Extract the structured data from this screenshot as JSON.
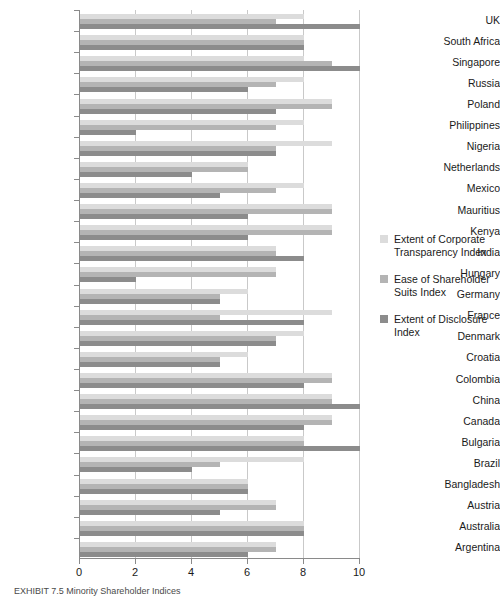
{
  "chart_data": {
    "type": "bar",
    "orientation": "horizontal",
    "title": "",
    "xlabel": "",
    "ylabel": "",
    "xlim": [
      0,
      10
    ],
    "xticks": [
      0,
      2,
      4,
      6,
      8,
      10
    ],
    "grid": true,
    "legend_position": "right",
    "categories": [
      "UK",
      "South Africa",
      "Singapore",
      "Russia",
      "Poland",
      "Philippines",
      "Nigeria",
      "Netherlands",
      "Mexico",
      "Mauritius",
      "Kenya",
      "India",
      "Hungary",
      "Germany",
      "France",
      "Denmark",
      "Croatia",
      "Colombia",
      "China",
      "Canada",
      "Bulgaria",
      "Brazil",
      "Bangladesh",
      "Austria",
      "Australia",
      "Argentina"
    ],
    "series": [
      {
        "name": "Extent of Corporate Transparency Index",
        "color": "#dcdcdc",
        "values": [
          8,
          8,
          8,
          8,
          9,
          8,
          9,
          6,
          8,
          9,
          9,
          7,
          7,
          6,
          9,
          8,
          6,
          9,
          9,
          9,
          8,
          8,
          6,
          7,
          8,
          7
        ]
      },
      {
        "name": "Ease of Shareholder Suits Index",
        "color": "#b4b4b4",
        "values": [
          7,
          8,
          9,
          7,
          9,
          7,
          7,
          6,
          7,
          9,
          9,
          7,
          7,
          5,
          5,
          7,
          5,
          9,
          9,
          9,
          8,
          5,
          6,
          7,
          8,
          7
        ]
      },
      {
        "name": "Extent of Disclosure Index",
        "color": "#8c8c8c",
        "values": [
          10,
          8,
          10,
          6,
          7,
          2,
          7,
          4,
          5,
          6,
          6,
          8,
          2,
          5,
          8,
          7,
          5,
          8,
          10,
          8,
          10,
          4,
          6,
          5,
          8,
          6
        ]
      }
    ]
  },
  "legend": {
    "entries": [
      "Extent of Corporate Transparency Index",
      "Ease of Shareholder Suits Index",
      "Extent of Disclosure Index"
    ],
    "entry_lines": [
      [
        "Extent of Corporate",
        "Transparency Index"
      ],
      [
        "Ease of Shareholder",
        "Suits Index"
      ],
      [
        "Extent of Disclosure",
        "Index"
      ]
    ]
  },
  "caption": {
    "text": "EXHIBIT 7.5  Minority Shareholder Indices"
  },
  "colors": {
    "series1": "#dcdcdc",
    "series2": "#b4b4b4",
    "series3": "#8c8c8c",
    "axis": "#8a8a8a",
    "grid": "#c9c9c9",
    "text": "#1a1a1a"
  }
}
